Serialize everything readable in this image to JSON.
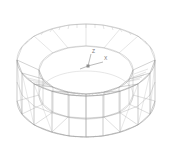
{
  "canvas": {
    "width": 173,
    "height": 151,
    "background_color": "#ffffff",
    "title": "3D wireframe mesh of hollow cylindrical ring solid"
  },
  "render": {
    "style": "wireframe",
    "line_color": "#8a8a8a",
    "line_color_faint": "#b5b5b5",
    "line_color_dark": "#6e6e6e",
    "line_width": 0.45,
    "shading": "none",
    "projection": "isometric-perspective"
  },
  "model": {
    "name": "hollow-cylinder-mesh",
    "description": "Annular drum / washer shaped solid meshed with quadrilateral shell elements and triangular fan patches",
    "geometry": {
      "type": "annulus_extrusion",
      "top_outer_ellipse": {
        "cx": 86,
        "cy": 60,
        "rx": 69,
        "ry": 36
      },
      "bottom_outer_ellipse": {
        "cx": 86,
        "cy": 101,
        "rx": 69,
        "ry": 36
      },
      "top_inner_ellipse": {
        "cx": 86,
        "cy": 70,
        "rx": 47,
        "ry": 24
      },
      "bottom_inner_ellipse": {
        "cx": 86,
        "cy": 95,
        "rx": 47,
        "ry": 24
      },
      "wall_height_px": 41,
      "facet_count": 16
    }
  },
  "axis_triad": {
    "name": "coordinate-axes",
    "origin": {
      "x": 88,
      "y": 66
    },
    "axes": [
      {
        "label": "Z",
        "dx": 3,
        "dy": -12,
        "label_x": 92,
        "label_y": 52
      },
      {
        "label": "X",
        "dx": 15,
        "dy": -4,
        "label_x": 104,
        "label_y": 58
      },
      {
        "label": "Y",
        "dx": -8,
        "dy": 3,
        "label_x": 79,
        "label_y": 70
      }
    ],
    "label_color": "#777777"
  }
}
